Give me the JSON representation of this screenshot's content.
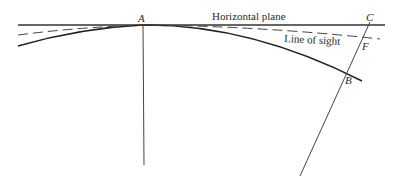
{
  "diagram": {
    "labels": {
      "point_a": "A",
      "point_b": "B",
      "point_c": "C",
      "point_f": "F",
      "horizontal_plane": "Horizontal plane",
      "line_of_sight": "Line of sight"
    },
    "colors": {
      "line": "#333333",
      "background": "#ffffff"
    }
  }
}
